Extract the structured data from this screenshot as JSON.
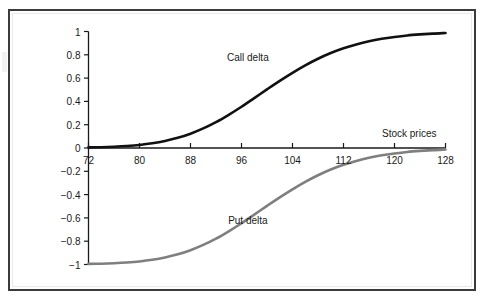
{
  "figure": {
    "background_color": "#ffffff",
    "frame_color": "#3b3b3b"
  },
  "chart_data": {
    "type": "line",
    "title": "",
    "subtitle": "",
    "xlabel": "Stock prices",
    "ylabel": "Option deltas",
    "xlim": [
      72,
      128
    ],
    "ylim": [
      -1,
      1
    ],
    "grid": false,
    "legend_position": "inline-annotations",
    "xticks": [
      72,
      80,
      88,
      96,
      104,
      112,
      120,
      128
    ],
    "xtick_labels": [
      "72",
      "80",
      "88",
      "96",
      "104",
      "112",
      "120",
      "128"
    ],
    "yticks": [
      1,
      0.8,
      0.6,
      0.4,
      0.2,
      0,
      -0.2,
      -0.4,
      -0.6,
      -0.8,
      -1
    ],
    "ytick_labels": [
      "1",
      "0.8",
      "0.6",
      "0.4",
      "0.2",
      "0",
      "−0.2",
      "−0.4",
      "−0.6",
      "−0.8",
      "−1"
    ],
    "annotations": [
      {
        "text": "Call delta",
        "x": 97,
        "y": 0.78
      },
      {
        "text": "Put delta",
        "x": 97,
        "y": -0.62
      },
      {
        "text": "Stock prices",
        "x": 124,
        "y": 0.14
      }
    ],
    "series": [
      {
        "name": "Call delta",
        "color": "#111111",
        "line_width": 2.6,
        "x": [
          72,
          74,
          76,
          78,
          80,
          82,
          84,
          86,
          88,
          90,
          92,
          94,
          96,
          98,
          100,
          102,
          104,
          106,
          108,
          110,
          112,
          114,
          116,
          118,
          120,
          122,
          124,
          126,
          128
        ],
        "values": [
          0.005,
          0.007,
          0.011,
          0.017,
          0.026,
          0.04,
          0.06,
          0.087,
          0.123,
          0.168,
          0.222,
          0.285,
          0.354,
          0.428,
          0.503,
          0.576,
          0.645,
          0.709,
          0.766,
          0.815,
          0.856,
          0.889,
          0.916,
          0.937,
          0.953,
          0.966,
          0.975,
          0.982,
          0.987
        ]
      },
      {
        "name": "Put delta",
        "color": "#7f7f7f",
        "line_width": 2.6,
        "x": [
          72,
          74,
          76,
          78,
          80,
          82,
          84,
          86,
          88,
          90,
          92,
          94,
          96,
          98,
          100,
          102,
          104,
          106,
          108,
          110,
          112,
          114,
          116,
          118,
          120,
          122,
          124,
          126,
          128
        ],
        "values": [
          -0.995,
          -0.993,
          -0.989,
          -0.983,
          -0.974,
          -0.96,
          -0.94,
          -0.913,
          -0.877,
          -0.832,
          -0.778,
          -0.715,
          -0.646,
          -0.572,
          -0.497,
          -0.424,
          -0.355,
          -0.291,
          -0.234,
          -0.185,
          -0.144,
          -0.111,
          -0.084,
          -0.063,
          -0.047,
          -0.034,
          -0.025,
          -0.018,
          -0.013
        ]
      }
    ]
  }
}
